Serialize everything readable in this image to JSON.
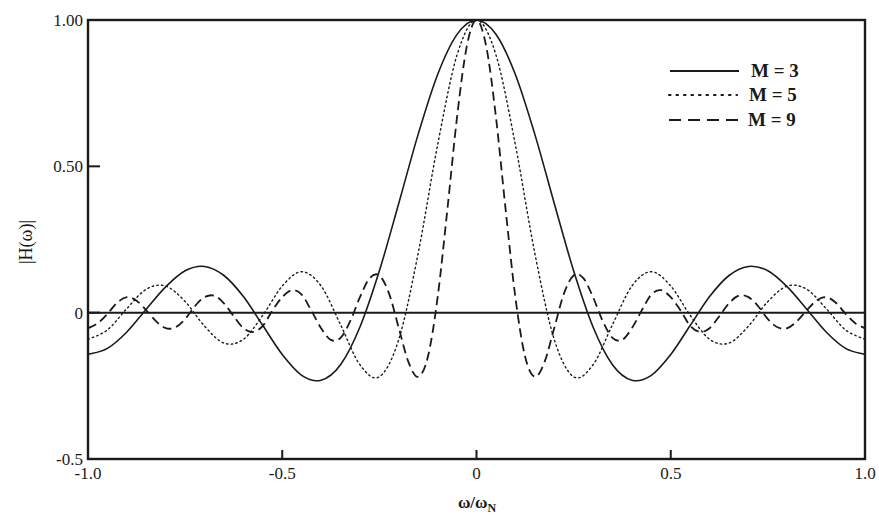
{
  "chart_data": {
    "type": "line",
    "title": "",
    "xlabel": "ω/ω",
    "xlabel_subscript": "N",
    "ylabel": "|H(ω)|",
    "xlim": [
      -1.0,
      1.0
    ],
    "ylim": [
      -0.5,
      1.0
    ],
    "grid": false,
    "legend_position": "upper right",
    "x_ticks": [
      {
        "value": -1.0,
        "label": "-1.0"
      },
      {
        "value": -0.5,
        "label": "-0.5"
      },
      {
        "value": 0,
        "label": "0"
      },
      {
        "value": 0.5,
        "label": "0.5"
      },
      {
        "value": 1.0,
        "label": "1.0"
      }
    ],
    "y_ticks": [
      {
        "value": 1.0,
        "label": "1.00"
      },
      {
        "value": 0.5,
        "label": "0.50"
      },
      {
        "value": 0,
        "label": "0"
      },
      {
        "value": -0.5,
        "label": "-0.5"
      }
    ],
    "zero_line": true,
    "symmetric_about_zero": true,
    "series": [
      {
        "name": "M = 3",
        "style": "solid",
        "x": [
          0,
          0.05,
          0.1,
          0.15,
          0.2,
          0.25,
          0.3,
          0.35,
          0.4,
          0.45,
          0.5,
          0.55,
          0.6,
          0.65,
          0.7,
          0.75,
          0.8,
          0.85,
          0.9,
          0.95,
          1.0
        ],
        "values": [
          1.0,
          0.951,
          0.814,
          0.61,
          0.374,
          0.143,
          -0.049,
          -0.178,
          -0.231,
          -0.214,
          -0.143,
          -0.044,
          0.055,
          0.127,
          0.158,
          0.143,
          0.088,
          0.012,
          -0.066,
          -0.122,
          -0.143
        ]
      },
      {
        "name": "M = 5",
        "style": "dotted",
        "x": [
          0,
          0.05,
          0.1,
          0.15,
          0.2,
          0.25,
          0.3,
          0.35,
          0.4,
          0.45,
          0.5,
          0.55,
          0.6,
          0.65,
          0.7,
          0.75,
          0.8,
          0.85,
          0.9,
          0.95,
          1.0
        ],
        "values": [
          1.0,
          0.881,
          0.574,
          0.204,
          -0.091,
          -0.219,
          -0.178,
          -0.041,
          0.091,
          0.14,
          0.091,
          -0.009,
          -0.091,
          -0.104,
          -0.046,
          0.038,
          0.091,
          0.08,
          0.014,
          -0.059,
          -0.091
        ]
      },
      {
        "name": "M = 9",
        "style": "dashed",
        "x": [
          0,
          0.025,
          0.05,
          0.075,
          0.1,
          0.125,
          0.15,
          0.175,
          0.2,
          0.225,
          0.25,
          0.275,
          0.3,
          0.325,
          0.35,
          0.375,
          0.4,
          0.425,
          0.45,
          0.475,
          0.5,
          0.525,
          0.55,
          0.575,
          0.6,
          0.625,
          0.65,
          0.675,
          0.7,
          0.725,
          0.75,
          0.775,
          0.8,
          0.825,
          0.85,
          0.875,
          0.9,
          0.925,
          0.95,
          0.975,
          1.0
        ],
        "values": [
          1.0,
          0.91,
          0.669,
          0.352,
          0.053,
          -0.15,
          -0.219,
          -0.169,
          -0.053,
          0.065,
          0.127,
          0.118,
          0.053,
          -0.029,
          -0.086,
          -0.093,
          -0.053,
          0.007,
          0.062,
          0.077,
          0.053,
          0.008,
          -0.045,
          -0.066,
          -0.053,
          -0.012,
          0.032,
          0.058,
          0.053,
          0.022,
          -0.022,
          -0.05,
          -0.053,
          -0.029,
          0.008,
          0.041,
          0.053,
          0.034,
          -0.004,
          -0.036,
          -0.053
        ]
      }
    ]
  },
  "legend": {
    "items": [
      {
        "label": "M = 3",
        "style": "solid"
      },
      {
        "label": "M = 5",
        "style": "dotted"
      },
      {
        "label": "M = 9",
        "style": "dashed"
      }
    ]
  },
  "colors": {
    "line": "#1a1a1a",
    "background": "#ffffff"
  }
}
